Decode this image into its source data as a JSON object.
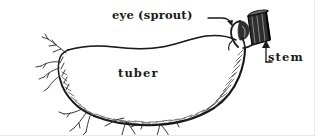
{
  "figure": {
    "kind": "botanical-line-drawing",
    "width": 315,
    "height": 136,
    "background_color": "#ffffff",
    "ink_color": "#1a1a1a"
  },
  "labels": {
    "eye": "eye (sprout)",
    "tuber": "tuber",
    "stem": "stem"
  },
  "leaders": {
    "eye_leader": "horizontal dash curving down to arrowhead pointing left-down at the sprout",
    "stem_leader": "L-shaped elbow with upward arrow pointing at the cut stem stub"
  },
  "parts": {
    "tuber_body": "large oval tuber, wavy top outline, heavily shaded lower-right edge",
    "sprout": "small leaf-like bud emerging at upper right of tuber",
    "stem_stub": "dark hatched cut stem block at top right",
    "roots_left": "thin branching root filaments on the left tip",
    "roots_bottom": "small root tufts along the shaded bottom edge",
    "shading": "dense short hatch strokes along bottom and right contour"
  }
}
